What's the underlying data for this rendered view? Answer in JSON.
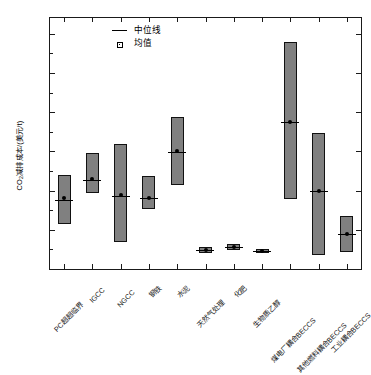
{
  "chart_data": {
    "type": "bar",
    "title": "",
    "xlabel": "",
    "ylabel": "CO2减排成本/(美元/t)",
    "ylabel_prefix": "CO",
    "ylabel_sub": "2",
    "ylabel_suffix": "减排成本/(美元/t)",
    "ylim": [
      0,
      320
    ],
    "ytick_labels": [
      "0",
      "50",
      "100",
      "150",
      "200",
      "250",
      "300"
    ],
    "ytick_values": [
      0,
      50,
      100,
      150,
      200,
      250,
      300
    ],
    "grid": false,
    "legend_position": "top-left",
    "legend": [
      {
        "label": "中位线",
        "marker": "line"
      },
      {
        "label": "均值",
        "marker": "square"
      }
    ],
    "categories": [
      "PC超超临界",
      "IGCC",
      "NGCC",
      "钢铁",
      "水泥",
      "天然气处理",
      "化肥",
      "生物质乙醇",
      "煤电厂耦合BECCS",
      "其他燃料耦合BECCS",
      "工业耦合BECCS"
    ],
    "series": [
      {
        "name": "低值",
        "values": [
          58,
          97,
          34,
          77,
          107,
          20,
          24,
          20,
          89,
          18,
          22
        ]
      },
      {
        "name": "高值",
        "values": [
          120,
          148,
          160,
          118,
          194,
          28,
          32,
          26,
          289,
          174,
          68
        ]
      },
      {
        "name": "中位线",
        "values": [
          88,
          114,
          93,
          90,
          149,
          24,
          28,
          23,
          188,
          99,
          44
        ]
      },
      {
        "name": "均值",
        "values": [
          90,
          115,
          94,
          91,
          150,
          24,
          28,
          23,
          188,
          100,
          45
        ]
      }
    ],
    "box_color": "#808080",
    "edge_color": "#111111"
  }
}
